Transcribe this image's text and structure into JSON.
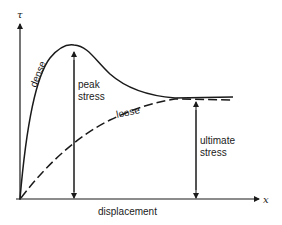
{
  "diagram": {
    "type": "stress-displacement curve",
    "axes": {
      "y_label": "τ",
      "x_label": "x",
      "x_title": "displacement"
    },
    "curves": [
      {
        "name": "dense",
        "label": "dense",
        "style": "solid"
      },
      {
        "name": "loose",
        "label": "loose",
        "style": "dashed"
      }
    ],
    "annotations": {
      "peak_line1": "peak",
      "peak_line2": "stress",
      "ultimate_line1": "ultimate",
      "ultimate_line2": "stress"
    },
    "colors": {
      "stroke": "#1a1a1a",
      "background": "#ffffff"
    }
  }
}
